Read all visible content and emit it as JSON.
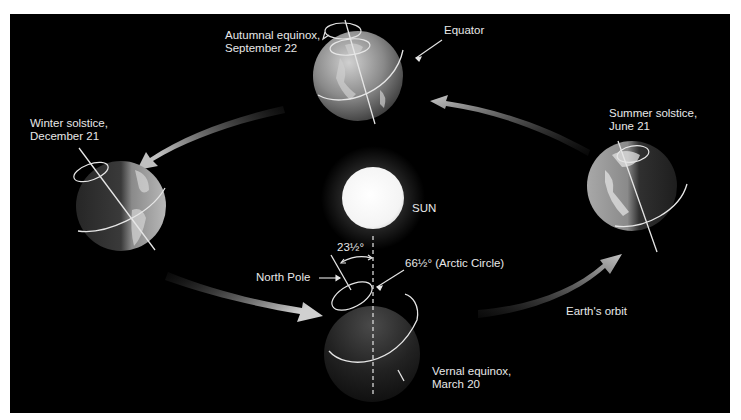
{
  "figure": {
    "background": "#000000",
    "page_background": "#ffffff"
  },
  "labels": {
    "autumnal": {
      "line1": "Autumnal equinox,",
      "line2": "September 22"
    },
    "equator": "Equator",
    "winter": {
      "line1": "Winter solstice,",
      "line2": "December 21"
    },
    "summer": {
      "line1": "Summer solstice,",
      "line2": "June 21"
    },
    "sun": "SUN",
    "tilt_angle": "23½°",
    "arctic_circle": "66½° (Arctic Circle)",
    "north_pole": "North Pole",
    "orbit": "Earth's orbit",
    "vernal": {
      "line1": "Vernal equinox,",
      "line2": "March 20"
    }
  },
  "bodies": [
    {
      "name": "sun",
      "cx": 373,
      "cy": 198,
      "r": 31
    },
    {
      "name": "earth-autumnal",
      "cx": 358,
      "cy": 76,
      "r": 45
    },
    {
      "name": "earth-winter",
      "cx": 121,
      "cy": 206,
      "r": 45
    },
    {
      "name": "earth-summer",
      "cx": 632,
      "cy": 186,
      "r": 45
    },
    {
      "name": "earth-vernal",
      "cx": 372,
      "cy": 354,
      "r": 48
    }
  ],
  "colors": {
    "label": "#e8e8e8",
    "arrow": "#b8b8b8",
    "sun_glow": "#ffffff",
    "globe_light": "#9a9a9a",
    "globe_dark": "#1a1a1a"
  }
}
